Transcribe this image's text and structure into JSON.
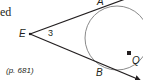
{
  "partial_text": "ed",
  "reference": "(p. 681)",
  "diagram": {
    "points": {
      "E": "E",
      "A": "A",
      "B": "B",
      "Q": "Q"
    },
    "angle_label": "3",
    "colors": {
      "line": "#231f20",
      "circle": "#8a8a8a",
      "text": "#231f20"
    }
  }
}
